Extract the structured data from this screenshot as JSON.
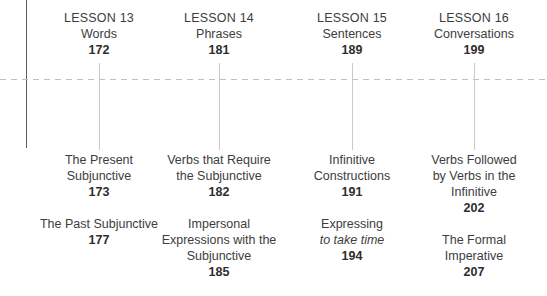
{
  "diagram": {
    "type": "timeline-contents",
    "background_color": "#ffffff",
    "text_color": "#3d3d3d",
    "rule_color": "#5b5b5b",
    "dashed_rule_color": "#c0c0c0",
    "connector_color": "#c9c9c9"
  },
  "columns": [
    {
      "lesson_label": "LESSON 13",
      "lesson_topic": "Words",
      "lesson_page": "172",
      "entries": [
        {
          "title_line1": "The Present",
          "title_line2": "Subjunctive",
          "page": "173"
        },
        {
          "title_line1": "The Past Subjunctive",
          "title_line2": "",
          "page": "177"
        }
      ]
    },
    {
      "lesson_label": "LESSON 14",
      "lesson_topic": "Phrases",
      "lesson_page": "181",
      "entries": [
        {
          "title_line1": "Verbs that Require",
          "title_line2": "the Subjunctive",
          "page": "182"
        },
        {
          "title_line1": "Impersonal",
          "title_line2": "Expressions with the",
          "title_line3": "Subjunctive",
          "page": "185"
        }
      ]
    },
    {
      "lesson_label": "LESSON 15",
      "lesson_topic": "Sentences",
      "lesson_page": "189",
      "entries": [
        {
          "title_line1": "Infinitive",
          "title_line2": "Constructions",
          "page": "191"
        },
        {
          "title_line1": "Expressing",
          "title_italic": "to take time",
          "page": "194"
        }
      ]
    },
    {
      "lesson_label": "LESSON 16",
      "lesson_topic": "Conversations",
      "lesson_page": "199",
      "entries": [
        {
          "title_line1": "Verbs Followed",
          "title_line2": "by Verbs in the",
          "title_line3": "Infinitive",
          "page": "202"
        },
        {
          "title_line1": "The Formal",
          "title_line2": "Imperative",
          "page": "207"
        }
      ]
    }
  ]
}
